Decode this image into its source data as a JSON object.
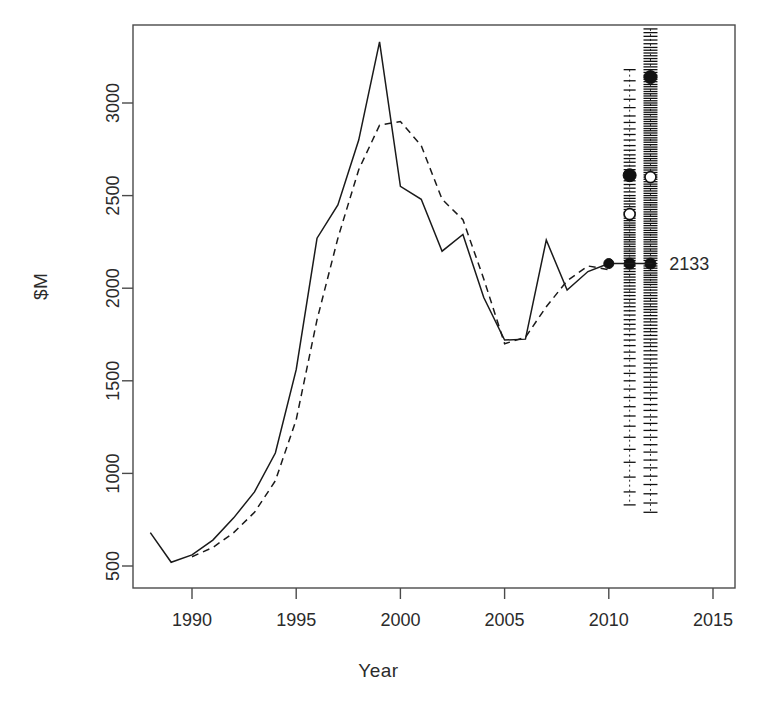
{
  "chart_data": {
    "type": "line",
    "title": "",
    "xlabel": "Year",
    "ylabel": "$M",
    "xlim": [
      1987.3,
      2016.1
    ],
    "ylim": [
      420,
      3400
    ],
    "grid": false,
    "legend": "none",
    "xticks": [
      1990,
      1995,
      2000,
      2005,
      2010,
      2015
    ],
    "yticks": [
      500,
      1000,
      1500,
      2000,
      2500,
      3000
    ],
    "series": [
      {
        "name": "solid",
        "style": "solid",
        "x": [
          1988,
          1989,
          1990,
          1991,
          1992,
          1993,
          1994,
          1995,
          1996,
          1997,
          1998,
          1999,
          2000,
          2001,
          2002,
          2003,
          2004,
          2005,
          2006,
          2007,
          2008,
          2009,
          2010
        ],
        "values": [
          680,
          520,
          560,
          640,
          760,
          900,
          1110,
          1560,
          2270,
          2450,
          2800,
          3330,
          2550,
          2480,
          2200,
          2290,
          1950,
          1720,
          1725,
          2260,
          1990,
          2090,
          2133
        ]
      },
      {
        "name": "dashed",
        "style": "dashed",
        "x": [
          1990,
          1991,
          1992,
          1993,
          1994,
          1995,
          1996,
          1997,
          1998,
          1999,
          2000,
          2001,
          2002,
          2003,
          2004,
          2005,
          2006,
          2007,
          2008,
          2009,
          2010
        ],
        "values": [
          550,
          600,
          680,
          790,
          960,
          1290,
          1830,
          2270,
          2640,
          2880,
          2900,
          2770,
          2480,
          2370,
          2050,
          1700,
          1735,
          1900,
          2040,
          2120,
          2100
        ]
      }
    ],
    "annotations": [
      {
        "name": "forecast-value",
        "label": "2133",
        "x": 2012.9,
        "y": 2133,
        "leader_from_x": 2010,
        "leader_to_x": 2012.1,
        "leader_y": 2133
      }
    ],
    "strip_plots": [
      {
        "name": "strip-2011",
        "year": 2011,
        "median_value": 2400,
        "mean_value": 2610,
        "point_value": 2133,
        "min_value": 830,
        "max_value": 3180,
        "values": [
          3180,
          3120,
          3070,
          3020,
          2975,
          2930,
          2895,
          2860,
          2830,
          2800,
          2770,
          2745,
          2720,
          2700,
          2680,
          2660,
          2640,
          2620,
          2610,
          2600,
          2580,
          2560,
          2540,
          2520,
          2500,
          2485,
          2470,
          2455,
          2440,
          2425,
          2410,
          2400,
          2390,
          2378,
          2365,
          2352,
          2340,
          2328,
          2315,
          2300,
          2288,
          2275,
          2262,
          2250,
          2238,
          2225,
          2212,
          2200,
          2188,
          2175,
          2162,
          2150,
          2133,
          2120,
          2105,
          2090,
          2075,
          2060,
          2045,
          2030,
          2012,
          1995,
          1978,
          1960,
          1940,
          1920,
          1900,
          1878,
          1855,
          1830,
          1805,
          1780,
          1750,
          1720,
          1690,
          1655,
          1620,
          1580,
          1540,
          1500,
          1455,
          1410,
          1360,
          1310,
          1255,
          1195,
          1130,
          1060,
          980,
          900,
          830
        ]
      },
      {
        "name": "strip-2012",
        "year": 2012,
        "median_value": 2600,
        "mean_value": 3140,
        "point_value": 2133,
        "min_value": 790,
        "max_value": 3400,
        "values": [
          3400,
          3380,
          3360,
          3340,
          3320,
          3300,
          3285,
          3270,
          3255,
          3240,
          3225,
          3210,
          3195,
          3180,
          3165,
          3150,
          3140,
          3128,
          3115,
          3100,
          3088,
          3075,
          3062,
          3050,
          3038,
          3025,
          3012,
          3000,
          2988,
          2975,
          2962,
          2950,
          2938,
          2925,
          2912,
          2900,
          2888,
          2875,
          2862,
          2850,
          2838,
          2825,
          2812,
          2800,
          2788,
          2775,
          2762,
          2750,
          2738,
          2725,
          2712,
          2700,
          2688,
          2675,
          2662,
          2650,
          2638,
          2625,
          2612,
          2600,
          2588,
          2575,
          2562,
          2550,
          2538,
          2525,
          2512,
          2500,
          2488,
          2475,
          2462,
          2450,
          2438,
          2425,
          2412,
          2400,
          2388,
          2375,
          2362,
          2350,
          2338,
          2325,
          2312,
          2300,
          2288,
          2275,
          2262,
          2250,
          2238,
          2225,
          2212,
          2200,
          2188,
          2175,
          2162,
          2150,
          2133,
          2120,
          2108,
          2095,
          2082,
          2070,
          2058,
          2045,
          2032,
          2020,
          2005,
          1990,
          1975,
          1960,
          1945,
          1930,
          1915,
          1900,
          1885,
          1870,
          1852,
          1835,
          1818,
          1800,
          1782,
          1765,
          1745,
          1725,
          1705,
          1685,
          1662,
          1640,
          1618,
          1595,
          1570,
          1545,
          1520,
          1492,
          1465,
          1435,
          1405,
          1372,
          1340,
          1305,
          1270,
          1232,
          1195,
          1155,
          1115,
          1072,
          1030,
          985,
          940,
          890,
          840,
          790
        ]
      }
    ]
  }
}
